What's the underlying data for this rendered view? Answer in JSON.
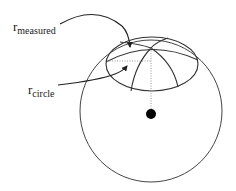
{
  "diagram": {
    "labels": {
      "measured": {
        "main": "r",
        "sub": "measured"
      },
      "circle": {
        "main": "r",
        "sub": "circle"
      }
    },
    "colors": {
      "stroke": "#333333",
      "center_dot": "#000000",
      "dotted": "#999999",
      "background": "#ffffff"
    },
    "shapes": {
      "sphere": {
        "cx": 151,
        "cy": 111,
        "r": 71
      },
      "center_dot": {
        "cx": 151,
        "cy": 114,
        "r": 5
      },
      "cap_apex": {
        "x": 151,
        "y": 48
      }
    }
  }
}
